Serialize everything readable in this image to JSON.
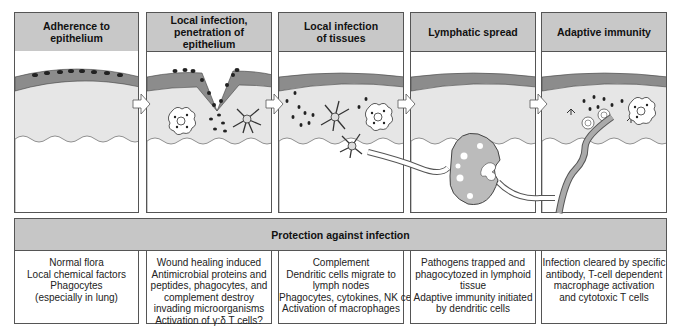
{
  "stages": [
    {
      "title": "Adherence to\nepithelium"
    },
    {
      "title": "Local infection,\npenetration of epithelium"
    },
    {
      "title": "Local infection\nof tissues"
    },
    {
      "title": "Lymphatic spread"
    },
    {
      "title": "Adaptive immunity"
    }
  ],
  "protection": {
    "title": "Protection against infection",
    "columns": [
      {
        "lines": [
          "Normal flora",
          "Local chemical factors",
          "Phagocytes",
          "(especially in lung)"
        ]
      },
      {
        "lines": [
          "Wound healing induced",
          "Antimicrobial proteins and",
          "peptides, phagocytes, and",
          "complement destroy",
          "invading microorganisms",
          "Activation of γ:δ T cells?"
        ]
      },
      {
        "lines": [
          "Complement",
          "Dendritic cells migrate to",
          "lymph nodes",
          "Phagocytes, cytokines, NK cells",
          "Activation of macrophages"
        ]
      },
      {
        "lines": [
          "Pathogens trapped and",
          "phagocytozed in lymphoid",
          "tissue",
          "Adaptive immunity initiated",
          "by dendritic cells"
        ]
      },
      {
        "lines": [
          "Infection cleared by specific",
          "antibody, T-cell dependent",
          "macrophage activation",
          "and cytotoxic T cells"
        ]
      }
    ]
  },
  "colors": {
    "header_fill": "#c8c8c8",
    "epithelium": "#8c8c8c",
    "tissue": "#e6e6e6",
    "border": "#555555"
  },
  "icons": [
    "bacteria-dots",
    "macrophage-icon",
    "dendritic-cell-icon",
    "lymph-node-icon",
    "lymphatic-vessel-icon",
    "antibody-icon",
    "t-cell-icon",
    "arrow-right-icon"
  ]
}
